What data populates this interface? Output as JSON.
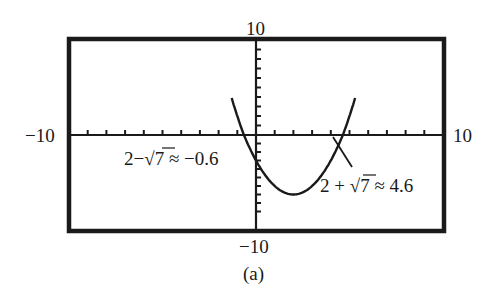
{
  "chart_data": {
    "type": "line",
    "title": "",
    "caption": "(a)",
    "function": "y = x^2 - 4x - 3",
    "xlabel": "",
    "ylabel": "",
    "xlim": [
      -10,
      10
    ],
    "ylim": [
      -10,
      10
    ],
    "x_tick_step": 1,
    "y_tick_step": 1,
    "grid": false,
    "axis_labels": {
      "x_min": "−10",
      "x_max": "10",
      "y_min": "−10",
      "y_max": "10"
    },
    "series": [
      {
        "name": "parabola",
        "x": [
          -1.1,
          -0.6,
          0,
          1,
          2,
          3,
          4,
          4.6,
          5.1
        ],
        "y": [
          2.6,
          0,
          -3,
          -6,
          -7,
          -6,
          -3,
          0,
          2.6
        ]
      }
    ],
    "annotations": [
      {
        "text_prefix": "2−",
        "radical": "7",
        "text_suffix": " ≈ −0.6",
        "x": -0.6,
        "y": 0
      },
      {
        "text_prefix": "2 + ",
        "radical": "7",
        "text_suffix": " ≈ 4.6",
        "x": 4.6,
        "y": 0
      }
    ],
    "colors": {
      "ink": "#1a1a1a",
      "background": "#ffffff"
    }
  }
}
